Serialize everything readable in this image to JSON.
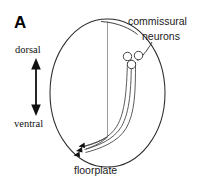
{
  "figure": {
    "panel_letter": "A",
    "background_color": "#ffffff",
    "width": 197,
    "height": 183
  },
  "labels": {
    "dorsal": "dorsal",
    "ventral": "ventral",
    "commissural_line1": "commissural",
    "commissural_line2": "neurons",
    "floorplate": "floorplate"
  },
  "colors": {
    "outline": "#2b2b2b",
    "midline": "#9a9a9a",
    "axon": "#4a4a4a",
    "soma_stroke": "#3a3a3a",
    "soma_fill": "#ffffff",
    "growth_cone": "#111111",
    "text": "#1a1a1a"
  },
  "diagram": {
    "type": "neuroanatomy-schematic",
    "outline_shape": "ellipse",
    "midline_present": true,
    "neuron_count": 3,
    "axon_count": 3,
    "growth_cone_count": 3,
    "orientation_axis": "dorsal-ventral"
  }
}
